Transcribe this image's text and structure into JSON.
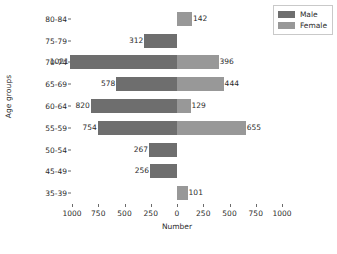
{
  "chart_data": {
    "type": "bar",
    "subtype": "population-pyramid",
    "orientation": "horizontal-diverging",
    "title": "",
    "xlabel": "Number",
    "ylabel": "Age groups",
    "categories": [
      "80-84",
      "75-79",
      "70-74",
      "65-69",
      "60-64",
      "55-59",
      "50-54",
      "45-49",
      "35-39"
    ],
    "series": [
      {
        "name": "Male",
        "color": "#6e6e6e",
        "direction": "left",
        "values": [
          0,
          312,
          1021,
          578,
          820,
          754,
          267,
          256,
          0
        ],
        "labels": [
          "",
          "312",
          "1021",
          "578",
          "820",
          "754",
          "267",
          "256",
          ""
        ]
      },
      {
        "name": "Female",
        "color": "#989898",
        "direction": "right",
        "values": [
          142,
          0,
          396,
          444,
          129,
          655,
          0,
          0,
          101
        ],
        "labels": [
          "142",
          "",
          "396",
          "444",
          "129",
          "655",
          "",
          "",
          "101"
        ]
      }
    ],
    "xticks": [
      -1000,
      -750,
      -500,
      -250,
      0,
      250,
      500,
      750,
      1000
    ],
    "xtick_labels": [
      "1000",
      "750",
      "500",
      "250",
      "0",
      "250",
      "500",
      "750",
      "1000"
    ],
    "xlim": [
      -1000,
      1000
    ],
    "grid": false,
    "legend_position": "upper right"
  },
  "legend": {
    "entries": [
      {
        "label": "Male"
      },
      {
        "label": "Female"
      }
    ]
  }
}
